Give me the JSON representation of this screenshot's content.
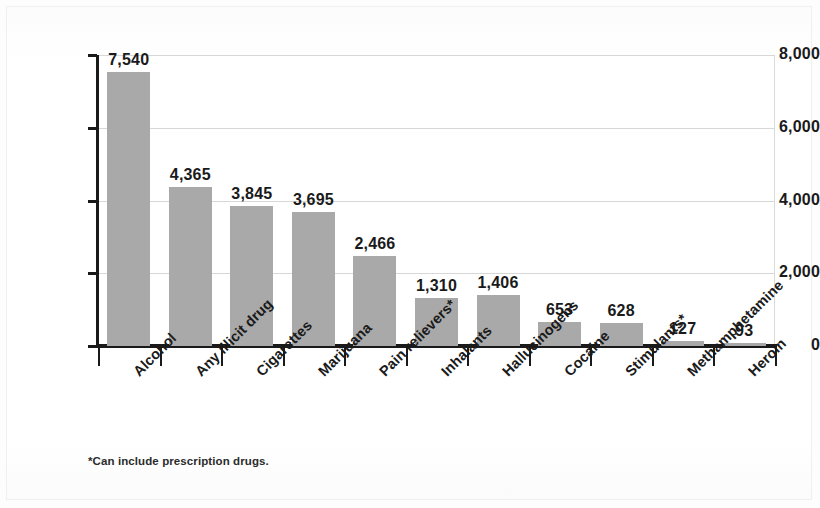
{
  "chart_data": {
    "type": "bar",
    "title": "",
    "subtitle": "",
    "xlabel": "",
    "ylabel": "",
    "ylim": [
      0,
      8000
    ],
    "grid": true,
    "legend": "none",
    "orientation": "vertical",
    "bar_color": "#a9a9a9",
    "categories": [
      "Alcohol",
      "Any illicit drug",
      "Cigarettes",
      "Marijuana",
      "Pain relievers*",
      "Inhalants",
      "Hallucinogens",
      "Cocaine",
      "Stimulants*",
      "Methamphetamine",
      "Heroin"
    ],
    "values": [
      7540,
      4365,
      3845,
      3695,
      2466,
      1310,
      1406,
      653,
      628,
      127,
      93
    ],
    "value_labels": [
      "7,540",
      "4,365",
      "3,845",
      "3,695",
      "2,466",
      "1,310",
      "1,406",
      "653",
      "628",
      "127",
      "93"
    ],
    "ytick_values": [
      0,
      2000,
      4000,
      6000,
      8000
    ],
    "ytick_labels": [
      "0",
      "2,000",
      "4,000",
      "6,000",
      "8,000"
    ]
  },
  "footnote": "*Can include prescription drugs."
}
